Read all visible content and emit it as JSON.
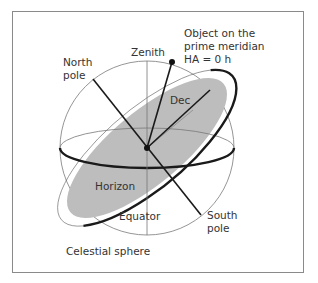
{
  "diagram": {
    "caption": "Celestial sphere",
    "labels": {
      "zenith": "Zenith",
      "north_pole_1": "North",
      "north_pole_2": "pole",
      "object_1": "Object on the",
      "object_2": "prime meridian",
      "object_3": "HA = 0 h",
      "dec": "Dec",
      "horizon": "Horizon",
      "equator": "Equator",
      "south_pole_1": "South",
      "south_pole_2": "pole"
    },
    "colors": {
      "horizon_fill": "#b9b9b9",
      "line": "#1a1a1a",
      "thin_line": "#777777",
      "frame": "#8a8a8a"
    }
  }
}
